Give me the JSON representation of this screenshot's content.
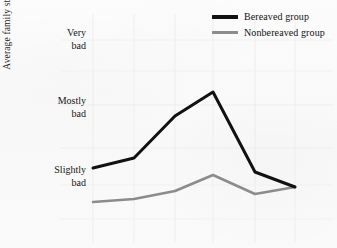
{
  "chart_data": {
    "type": "line",
    "title": "",
    "subtitle": "",
    "xlabel": "",
    "ylabel": "Average family stress",
    "grid": true,
    "grid_style": "faint light gray, vertical at each x position and horizontal at each y tick",
    "legend_position": "top-right",
    "x": [
      1,
      2,
      3,
      4,
      5,
      6
    ],
    "xtick_labels": [
      "",
      "",
      "",
      "",
      "",
      ""
    ],
    "x_axis_visible": false,
    "ylim": [
      0,
      3
    ],
    "ytick_values": [
      3,
      2,
      1
    ],
    "ytick_labels": [
      "Very bad",
      "Mostly bad",
      "Slightly bad"
    ],
    "ytick_labels_wrapped": [
      [
        "Very",
        "bad"
      ],
      [
        "Mostly",
        "bad"
      ],
      [
        "Slightly",
        "bad"
      ]
    ],
    "series": [
      {
        "name": "Bereaved group",
        "color": "#111111",
        "linewidth": 3.0,
        "values": [
          1.13,
          1.28,
          1.89,
          2.24,
          1.07,
          0.85
        ],
        "pixel_points": [
          [
            93,
            168
          ],
          [
            134,
            158
          ],
          [
            175,
            116
          ],
          [
            213,
            92
          ],
          [
            255,
            172
          ],
          [
            295,
            187
          ]
        ]
      },
      {
        "name": "Nonbereaved group",
        "color": "#8c8c8c",
        "linewidth": 2.6,
        "values": [
          0.64,
          0.68,
          0.8,
          1.03,
          0.76,
          0.85
        ],
        "pixel_points": [
          [
            93,
            202
          ],
          [
            134,
            199
          ],
          [
            175,
            191
          ],
          [
            213,
            175
          ],
          [
            255,
            194
          ],
          [
            295,
            187
          ]
        ]
      }
    ],
    "annotations": []
  },
  "axis": {
    "y_title": "Average family stress"
  },
  "legend": {
    "items": [
      {
        "label": "Bereaved group",
        "color": "#111111"
      },
      {
        "label": "Nonbereaved group",
        "color": "#8c8c8c"
      }
    ]
  },
  "colors": {
    "bereaved": "#111111",
    "nonbereaved": "#8c8c8c",
    "background": "#fbfbfb",
    "gridline": "#ededed",
    "text": "#151515"
  }
}
